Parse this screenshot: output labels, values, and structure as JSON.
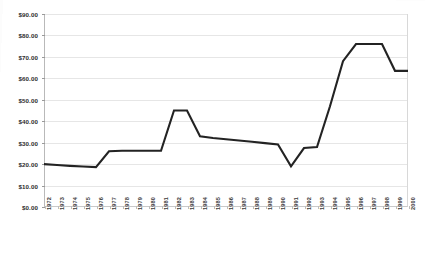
{
  "chart_data": {
    "type": "line",
    "title": "",
    "subtitle": "",
    "xlabel": "",
    "ylabel": "",
    "grid": true,
    "legend": "none",
    "ylim": [
      0,
      90
    ],
    "ytick_labels": [
      "$90.00",
      "$80.00",
      "$70.00",
      "$60.00",
      "$50.00",
      "$40.00",
      "$30.00",
      "$20.00",
      "$10.00",
      "$0.00"
    ],
    "ytick_values": [
      90,
      80,
      70,
      60,
      50,
      40,
      30,
      20,
      10,
      0
    ],
    "categories": [
      "1972",
      "1973",
      "1974",
      "1975",
      "1976",
      "1977",
      "1978",
      "1979",
      "1980",
      "1981",
      "1982",
      "1983",
      "1984",
      "1985",
      "1986",
      "1987",
      "1988",
      "1989",
      "1990",
      "1991",
      "1992",
      "1993",
      "1994",
      "1995",
      "1996",
      "1997",
      "1998",
      "1999",
      "2000"
    ],
    "series": [
      {
        "name": "price",
        "line_color": "#232323",
        "values": [
          20.0,
          19.6,
          19.2,
          18.9,
          18.6,
          26.0,
          26.2,
          26.2,
          26.2,
          26.2,
          45.0,
          45.0,
          33.0,
          32.2,
          31.6,
          31.0,
          30.4,
          29.8,
          29.2,
          19.0,
          27.5,
          28.0,
          47.0,
          68.0,
          76.0,
          76.0,
          76.0,
          63.5,
          63.5
        ]
      }
    ]
  }
}
